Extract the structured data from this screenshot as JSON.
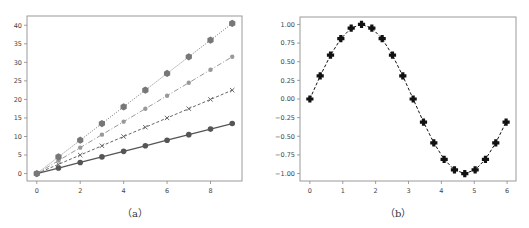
{
  "chart_data": [
    {
      "id": "a",
      "type": "line",
      "caption": "（a）",
      "title": "",
      "xlabel": "",
      "ylabel": "",
      "xlim": [
        -0.45,
        9.45
      ],
      "ylim": [
        -2.0,
        42.5
      ],
      "xticks": [
        0,
        2,
        4,
        6,
        8
      ],
      "yticks": [
        0,
        5,
        10,
        15,
        20,
        25,
        30,
        35,
        40
      ],
      "grid": false,
      "legend": null,
      "x": [
        0,
        1,
        2,
        3,
        4,
        5,
        6,
        7,
        8,
        9
      ],
      "series": [
        {
          "name": "y=1.5x",
          "linestyle": "solid",
          "marker": "circle",
          "color": "#555555",
          "values": [
            0,
            1.5,
            3.0,
            4.5,
            6.0,
            7.5,
            9.0,
            10.5,
            12.0,
            13.5
          ]
        },
        {
          "name": "y=2.5x",
          "linestyle": "dashed",
          "marker": "x",
          "color": "#666666",
          "values": [
            0,
            2.5,
            5.0,
            7.5,
            10.0,
            12.5,
            15.0,
            17.5,
            20.0,
            22.5
          ]
        },
        {
          "name": "y=3.5x",
          "linestyle": "dashdot",
          "marker": "small-circle",
          "color": "#999999",
          "values": [
            0,
            3.5,
            7.0,
            10.5,
            14.0,
            17.5,
            21.0,
            24.5,
            28.0,
            31.5
          ]
        },
        {
          "name": "y=4.5x",
          "linestyle": "dotted",
          "marker": "hexagon",
          "color": "#777777",
          "values": [
            0,
            4.5,
            9.0,
            13.5,
            18.0,
            22.5,
            27.0,
            31.5,
            36.0,
            40.5
          ]
        }
      ]
    },
    {
      "id": "b",
      "type": "line",
      "caption": "（b）",
      "title": "",
      "xlabel": "",
      "ylabel": "",
      "xlim": [
        -0.3,
        6.27
      ],
      "ylim": [
        -1.1,
        1.1
      ],
      "xticks": [
        0,
        1,
        2,
        3,
        4,
        5,
        6
      ],
      "yticks": [
        -1.0,
        -0.75,
        -0.5,
        -0.25,
        0.0,
        0.25,
        0.5,
        0.75,
        1.0
      ],
      "ytick_labels": [
        "−1.00",
        "−0.75",
        "−0.50",
        "−0.25",
        "0.00",
        "0.25",
        "0.50",
        "0.75",
        "1.00"
      ],
      "grid": false,
      "legend": null,
      "series": [
        {
          "name": "sin(x)",
          "linestyle": "dashed",
          "marker": "plus-filled",
          "color": "#111111",
          "x": [
            0,
            0.314,
            0.628,
            0.942,
            1.257,
            1.571,
            1.885,
            2.199,
            2.513,
            2.827,
            3.142,
            3.456,
            3.77,
            4.084,
            4.398,
            4.712,
            5.027,
            5.341,
            5.655,
            5.969
          ],
          "values": [
            0.0,
            0.309,
            0.588,
            0.809,
            0.951,
            1.0,
            0.951,
            0.809,
            0.588,
            0.309,
            0.0,
            -0.309,
            -0.588,
            -0.809,
            -0.951,
            -1.0,
            -0.951,
            -0.809,
            -0.588,
            -0.309
          ]
        }
      ]
    }
  ]
}
